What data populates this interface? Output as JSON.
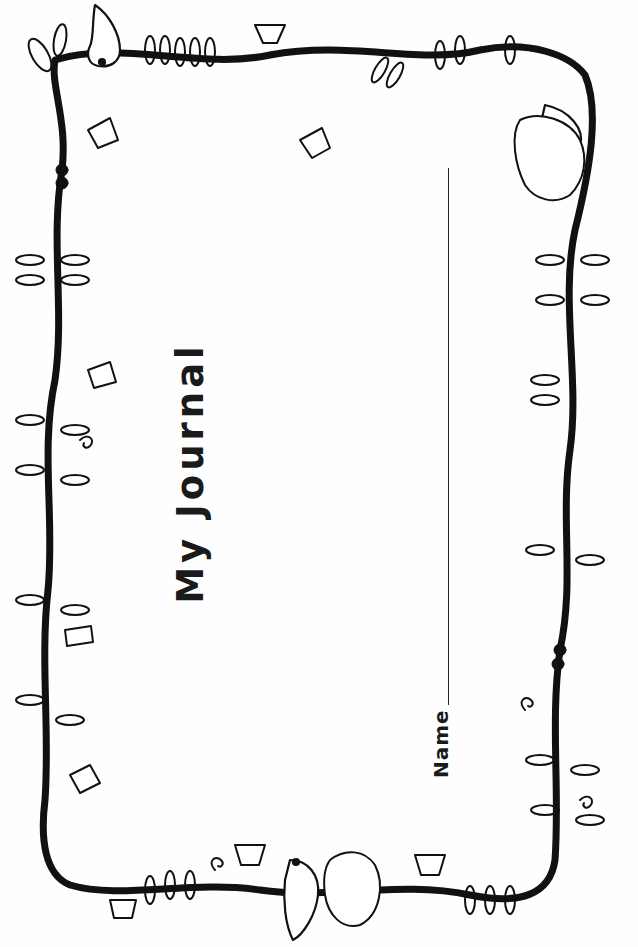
{
  "document": {
    "type": "journal cover",
    "orientation": "rotated 90 degrees (text reads bottom to top)",
    "title": "My Journal",
    "name_field": {
      "label": "Name",
      "value": ""
    },
    "border": {
      "style": "hand-drawn vine border",
      "decorations": [
        "birds",
        "bird nest",
        "morning-glory flowers",
        "leafy fronds",
        "curled tendrils",
        "knotted vine"
      ]
    },
    "colors": {
      "ink": "#1a1a1a",
      "paper": "#fefefe"
    }
  }
}
